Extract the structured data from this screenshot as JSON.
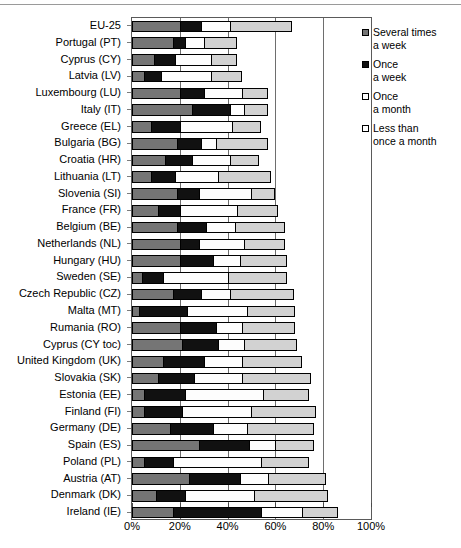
{
  "chart_data": {
    "type": "bar",
    "orientation": "horizontal",
    "stacked": true,
    "title": "",
    "xlabel": "",
    "ylabel": "",
    "xlim": [
      0,
      100
    ],
    "xticks": [
      "0%",
      "20%",
      "40%",
      "60%",
      "80%",
      "100%"
    ],
    "xtick_values": [
      0,
      20,
      40,
      60,
      80,
      100
    ],
    "grid": true,
    "legend_position": "right",
    "series": [
      {
        "name": "Several times\na week",
        "color": "#757575",
        "values": [
          20,
          17,
          9,
          5,
          20,
          25,
          8,
          19,
          14,
          8,
          19,
          11,
          19,
          20,
          20,
          4,
          17,
          3,
          20,
          21,
          13,
          11,
          5,
          5,
          16,
          28,
          5,
          24,
          10,
          17
        ]
      },
      {
        "name": "Once\na week",
        "color": "#111111",
        "values": [
          9,
          5,
          9,
          7,
          10,
          16,
          12,
          10,
          11,
          10,
          9,
          9,
          12,
          8,
          14,
          9,
          12,
          20,
          15,
          15,
          17,
          15,
          17,
          16,
          18,
          21,
          12,
          21,
          12,
          37
        ]
      },
      {
        "name": "Once\na month",
        "color": "#ffffff",
        "values": [
          12,
          8,
          15,
          21,
          16,
          6,
          22,
          6,
          16,
          18,
          22,
          24,
          12,
          19,
          11,
          27,
          12,
          25,
          11,
          11,
          16,
          20,
          33,
          29,
          14,
          11,
          37,
          12,
          29,
          17
        ]
      },
      {
        "name": "Less than\nonce a month",
        "color": "#d2d2d2",
        "values": [
          26,
          14,
          11,
          13,
          11,
          10,
          12,
          22,
          12,
          22,
          10,
          17,
          21,
          17,
          20,
          25,
          27,
          20,
          22,
          22,
          25,
          29,
          19,
          27,
          28,
          16,
          20,
          24,
          31,
          15
        ]
      }
    ],
    "categories": [
      "EU-25",
      "Portugal (PT)",
      "Cyprus (CY)",
      "Latvia (LV)",
      "Luxembourg (LU)",
      "Italy (IT)",
      "Greece (EL)",
      "Bulgaria (BG)",
      "Croatia (HR)",
      "Lithuania (LT)",
      "Slovenia (SI)",
      "France (FR)",
      "Belgium (BE)",
      "Netherlands (NL)",
      "Hungary (HU)",
      "Sweden (SE)",
      "Czech Republic (CZ)",
      "Malta (MT)",
      "Rumania (RO)",
      "Cyprus (CY toc)",
      "United Kingdom (UK)",
      "Slovakia (SK)",
      "Estonia (EE)",
      "Finland (FI)",
      "Germany (DE)",
      "Spain (ES)",
      "Poland (PL)",
      "Austria (AT)",
      "Denmark (DK)",
      "Ireland (IE)"
    ]
  }
}
